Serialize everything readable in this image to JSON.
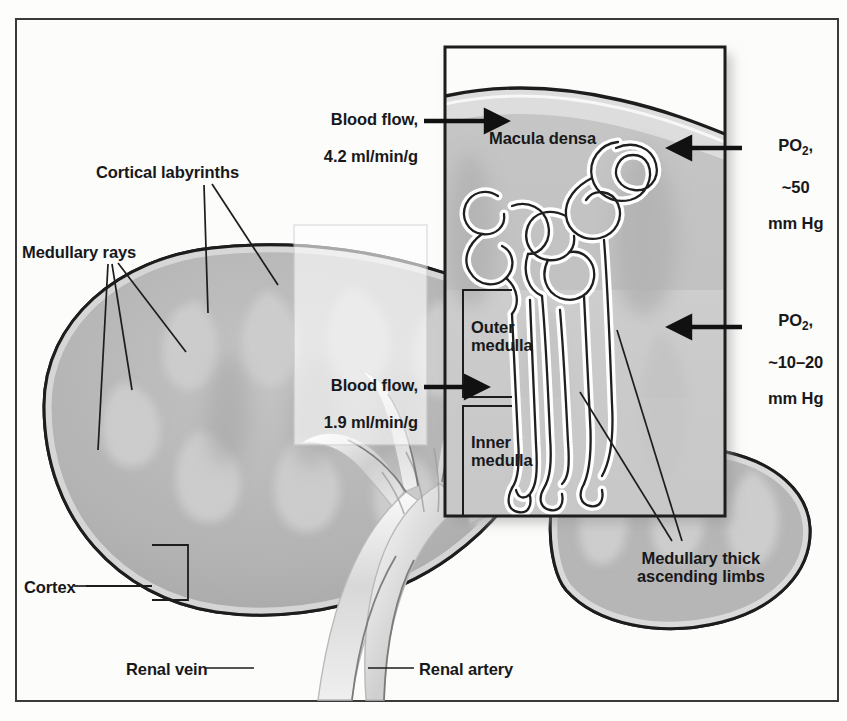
{
  "figure": {
    "frame_color": "#3a3a3a",
    "background_color": "#fcfcfb"
  },
  "palette": {
    "cortex_fill": "#b4b4b4",
    "medulla_fill": "#c9c9c9",
    "pyramid_fill": "#a8a8a8",
    "inset_cortex_fill": "#bdbdbd",
    "inset_medulla_fill": "#cfcfcf",
    "outline": "#1d1d1d",
    "vessel_fill": "#e4e4e4",
    "callout_overlay": "#f2f2f0",
    "text": "#18181a"
  },
  "labels": {
    "cortical_labyrinths": "Cortical labyrinths",
    "medullary_rays": "Medullary rays",
    "cortex": "Cortex",
    "renal_vein": "Renal vein",
    "renal_artery": "Renal artery",
    "macula_densa": "Macula densa",
    "outer_medulla": "Outer\nmedulla",
    "inner_medulla": "Inner\nmedulla",
    "medullary_thick_ascending_limbs": "Medullary thick\nascending limbs"
  },
  "measurements": {
    "blood_flow_cortex": {
      "line1": "Blood flow,",
      "line2": "4.2 ml/min/g",
      "value": 4.2,
      "unit": "ml/min/g",
      "region": "cortex"
    },
    "blood_flow_medulla": {
      "line1": "Blood flow,",
      "line2": "1.9 ml/min/g",
      "value": 1.9,
      "unit": "ml/min/g",
      "region": "medulla"
    },
    "po2_cortex": {
      "symbol": "PO",
      "subscript": "2",
      "symbol_suffix": ",",
      "line2": "~50",
      "line3": "mm Hg",
      "value": "~50",
      "unit": "mm Hg",
      "region": "cortex"
    },
    "po2_medulla": {
      "symbol": "PO",
      "subscript": "2",
      "symbol_suffix": ",",
      "line2": "~10–20",
      "line3": "mm Hg",
      "value": "~10–20",
      "unit": "mm Hg",
      "region": "medulla"
    }
  }
}
